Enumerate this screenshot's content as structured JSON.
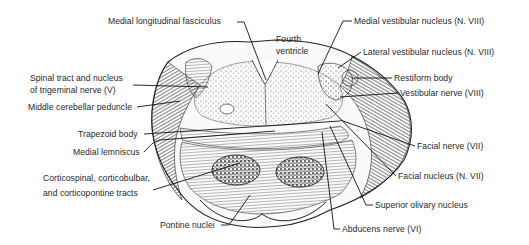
{
  "figure": {
    "labels": {
      "medial_longitudinal_fasciculus": "Medial longitudinal fasciculus",
      "fourth_ventricle": "Fourth\nventricle",
      "medial_vestibular_nucleus": "Medial vestibular nucleus (N. VIII)",
      "lateral_vestibular_nucleus": "Lateral vestibular nucleus (N. VIII)",
      "restiform_body": "Restiform body",
      "vestibular_nerve": "Vestibular nerve (VIII)",
      "spinal_tract_trigeminal": "Spinal tract and nucleus\nof trigeminal nerve (V)",
      "middle_cerebellar_peduncle": "Middle cerebellar peduncle",
      "trapezoid_body": "Trapezoid body",
      "medial_lemniscus": "Medial lemniscus",
      "facial_nerve": "Facial nerve (VII)",
      "facial_nucleus": "Facial nucleus (N. VII)",
      "corticospinal_tracts": "Corticospinal, corticobulbar,\nand corticopontine tracts",
      "superior_olivary_nucleus": "Superior olivary nucleus",
      "pontine_nuclei": "Pontine nuclei",
      "abducens_nerve": "Abducens nerve (VI)"
    },
    "colors": {
      "background": "#ffffff",
      "ink": "#1a1a1a",
      "shade": "#6b6b6b"
    }
  }
}
